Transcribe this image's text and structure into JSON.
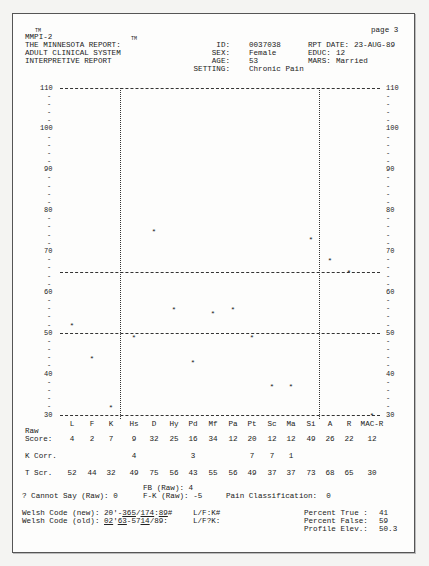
{
  "header": {
    "tm1": "TM",
    "product": "MMPI-2",
    "tm2": "TM",
    "line1": "THE MINNESOTA REPORT:",
    "line2": "ADULT CLINICAL SYSTEM",
    "line3": "INTERPRETIVE REPORT",
    "page": "page 3",
    "id_label": "ID:",
    "id_value": "0037038",
    "sex_label": "SEX:",
    "sex_value": "Female",
    "age_label": "AGE:",
    "age_value": "53",
    "setting_label": "SETTING:",
    "setting_value": "Chronic Pain",
    "rpt_date_label": "RPT DATE:",
    "rpt_date_value": "23-AUG-89",
    "educ_label": "EDUC:",
    "educ_value": "12",
    "mars_label": "MARS:",
    "mars_value": "Married"
  },
  "chart_data": {
    "type": "scatter",
    "xlabel": "",
    "ylabel": "T Score",
    "ylim": [
      30,
      110
    ],
    "y_ticks": [
      110,
      100,
      90,
      80,
      70,
      60,
      50,
      40,
      30
    ],
    "reference_lines": [
      30,
      50,
      65,
      110
    ],
    "groups": [
      [
        "L",
        "F",
        "K"
      ],
      [
        "Hs",
        "D",
        "Hy",
        "Pd",
        "Mf",
        "Pa",
        "Pt",
        "Sc",
        "Ma",
        "Si"
      ],
      [
        "A",
        "R",
        "MAC-R"
      ]
    ],
    "categories": [
      "L",
      "F",
      "K",
      "Hs",
      "D",
      "Hy",
      "Pd",
      "Mf",
      "Pa",
      "Pt",
      "Sc",
      "Ma",
      "Si",
      "A",
      "R",
      "MAC-R"
    ],
    "series": [
      {
        "name": "Raw Score",
        "values": [
          4,
          2,
          7,
          9,
          32,
          25,
          16,
          34,
          12,
          20,
          12,
          12,
          49,
          26,
          22,
          12
        ]
      },
      {
        "name": "K Corr.",
        "values": [
          null,
          null,
          null,
          4,
          null,
          null,
          3,
          null,
          null,
          7,
          7,
          1,
          null,
          null,
          null,
          null
        ]
      },
      {
        "name": "T Scr.",
        "values": [
          52,
          44,
          32,
          49,
          75,
          56,
          43,
          55,
          56,
          49,
          37,
          37,
          73,
          68,
          65,
          30
        ]
      }
    ]
  },
  "scale": {
    "left_labels": [
      "110",
      "100",
      "90",
      "80",
      "70",
      "60",
      "50",
      "40",
      "30"
    ],
    "right_labels": [
      "110",
      "100",
      "90",
      "80",
      "70",
      "60",
      "50",
      "40",
      "30"
    ]
  },
  "table": {
    "row_raw_1": "Raw",
    "row_raw_2": "Score:",
    "row_kcorr": "K Corr.",
    "row_tscr": "T Scr."
  },
  "footer": {
    "fb": "FB (Raw): 4",
    "cannot_say": "? Cannot Say (Raw): 0",
    "fk": "F-K (Raw): -5",
    "pain": "Pain Classification:  0",
    "welsh_new_label": "Welsh Code (new): ",
    "welsh_new_p1": "20'-",
    "welsh_new_p2": "365",
    "welsh_new_p3": "/",
    "welsh_new_p4": "174",
    "welsh_new_p5": ":",
    "welsh_new_p6": "89",
    "welsh_new_p7": "#",
    "welsh_new_lfk": "L/F:K#",
    "welsh_old_label": "Welsh Code (old): ",
    "welsh_old_p1": "02",
    "welsh_old_p2": "'",
    "welsh_old_p3": "63",
    "welsh_old_p4": "-57",
    "welsh_old_p5": "14",
    "welsh_old_p6": "/89:",
    "welsh_old_lfk": "L/F?K:",
    "pct_true_label": "Percent True :",
    "pct_true": "41",
    "pct_false_label": "Percent False:",
    "pct_false": "59",
    "profile_elev_label": "Profile Elev.:",
    "profile_elev": "50.3"
  }
}
